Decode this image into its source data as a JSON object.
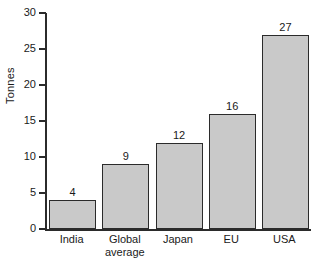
{
  "chart_data": {
    "type": "bar",
    "title": "",
    "xlabel": "",
    "ylabel": "Tonnes",
    "categories": [
      "India",
      "Global average",
      "Japan",
      "EU",
      "USA"
    ],
    "category_lines": [
      [
        "India"
      ],
      [
        "Global",
        "average"
      ],
      [
        "Japan"
      ],
      [
        "EU"
      ],
      [
        "USA"
      ]
    ],
    "values": [
      4,
      9,
      12,
      16,
      27
    ],
    "value_labels": [
      "4",
      "9",
      "12",
      "16",
      "27"
    ],
    "ylim": [
      0,
      30
    ],
    "yticks": [
      0,
      5,
      10,
      15,
      20,
      25,
      30
    ],
    "ytick_labels": [
      "0",
      "5",
      "10",
      "15",
      "20",
      "25",
      "30"
    ],
    "grid": false,
    "legend": false,
    "legend_position": "none",
    "bar_fill_color": "#c9c9c9",
    "bar_edge_color": "#2b2b2b",
    "axis_color": "#2b2b2b",
    "background_color": "#ffffff",
    "text_color": "#1a1a1a"
  }
}
